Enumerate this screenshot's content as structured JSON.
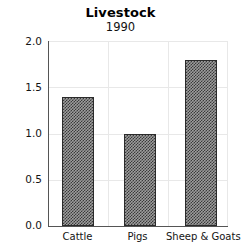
{
  "chart_data": {
    "type": "bar",
    "title": "Livestock",
    "subtitle": "1990",
    "xlabel": "",
    "ylabel": "million head",
    "categories": [
      "Cattle",
      "Pigs",
      "Sheep & Goats"
    ],
    "values": [
      1.4,
      1.0,
      1.8
    ],
    "ylim": [
      0.0,
      2.0
    ],
    "yticks": [
      "0.0",
      "0.5",
      "1.0",
      "1.5",
      "2.0"
    ],
    "ytick_values": [
      0.0,
      0.5,
      1.0,
      1.5,
      2.0
    ],
    "grid": "horizontal-and-category-separators",
    "legend": "none",
    "bar_style": "checkerboard-hatch",
    "colors": {
      "bar_fill": "#9d9d9d",
      "bar_hatch": "#3a3a3a",
      "bar_edge": "#2b2b2b",
      "gridline": "#e8e8e8",
      "axis": "#555555",
      "background": "#ffffff",
      "text": "#141414"
    }
  }
}
